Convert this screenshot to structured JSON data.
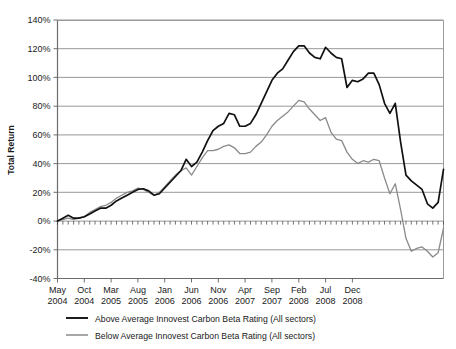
{
  "chart_data": {
    "type": "line",
    "title": "",
    "xlabel": "",
    "ylabel": "Total Return",
    "ylim": [
      -40,
      140
    ],
    "ytick_values": [
      -40,
      -20,
      0,
      20,
      40,
      60,
      80,
      100,
      120,
      140
    ],
    "ytick_labels": [
      "-40%",
      "-20%",
      "0%",
      "20%",
      "40%",
      "60%",
      "80%",
      "100%",
      "120%",
      "140%"
    ],
    "grid": true,
    "legend_position": "below",
    "x_tick_labels": [
      {
        "month": "May",
        "year": "2004"
      },
      {
        "month": "Oct",
        "year": "2004"
      },
      {
        "month": "Mar",
        "year": "2005"
      },
      {
        "month": "Aug",
        "year": "2005"
      },
      {
        "month": "Jan",
        "year": "2006"
      },
      {
        "month": "Jun",
        "year": "2006"
      },
      {
        "month": "Nov",
        "year": "2006"
      },
      {
        "month": "Apr",
        "year": "2007"
      },
      {
        "month": "Sep",
        "year": "2007"
      },
      {
        "month": "Feb",
        "year": "2008"
      },
      {
        "month": "Jul",
        "year": "2008"
      },
      {
        "month": "Dec",
        "year": "2008"
      }
    ],
    "x_tick_interval_months": 5,
    "x_start": "May 2004",
    "x_end": "Feb 2009",
    "n_points": 58,
    "series": [
      {
        "name": "Above Average Innovest Carbon Beta Rating (All sectors)",
        "color": "#111111",
        "values": [
          0,
          2,
          4,
          2,
          2,
          3,
          5,
          7,
          9,
          9,
          11,
          14,
          16,
          18,
          20,
          22,
          22.5,
          21,
          18,
          19,
          23,
          27,
          31,
          35,
          43,
          38,
          41,
          48,
          56,
          63,
          66,
          68,
          75,
          74,
          66,
          66,
          68,
          74,
          82,
          90,
          98,
          103,
          106,
          112,
          118,
          122,
          122,
          117,
          114,
          113,
          121,
          117,
          114,
          113,
          93,
          98,
          97,
          99
        ]
      },
      {
        "name": "Below Average Innovest Carbon Beta Rating (All sectors)",
        "color": "#8a8a8a",
        "values": [
          0,
          1,
          2,
          1,
          2,
          3,
          6,
          8,
          10,
          11,
          13,
          16,
          18,
          20,
          21,
          23,
          22,
          20,
          18,
          20,
          24,
          28,
          32,
          35,
          37,
          32,
          38,
          44,
          49,
          49,
          50,
          52,
          53,
          51,
          47,
          47,
          48,
          52,
          55,
          60,
          66,
          70,
          73,
          76,
          80,
          84,
          83,
          78,
          74,
          70,
          72,
          62,
          57,
          56,
          48,
          43,
          40,
          42
        ]
      }
    ],
    "series_tail": {
      "note": "values continue to Feb 2009",
      "above": [
        103,
        103,
        95,
        82,
        75,
        82,
        55,
        32,
        28,
        25,
        22,
        12,
        9,
        13,
        36
      ],
      "below": [
        41,
        43,
        42,
        30,
        19,
        26,
        8,
        -12,
        -21,
        -19,
        -18,
        -21,
        -25,
        -22,
        -5
      ]
    }
  },
  "legend": {
    "entries": [
      {
        "label": "Above Average Innovest Carbon Beta Rating (All sectors)",
        "color": "#111111"
      },
      {
        "label": "Below Average Innovest Carbon Beta Rating (All sectors)",
        "color": "#8a8a8a"
      }
    ]
  },
  "axis": {
    "y_title": "Total Return"
  }
}
